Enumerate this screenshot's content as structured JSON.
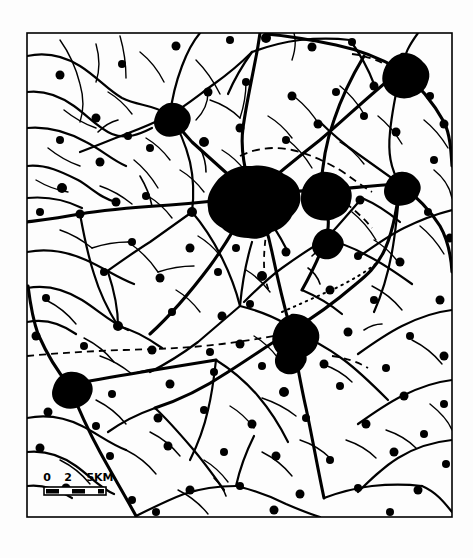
{
  "figure": {
    "kind": "scanned-map",
    "background_color": "#fdfdfd",
    "ink_color": "#000000",
    "width": 473,
    "height": 558
  },
  "frame": {
    "name": "map-neatline",
    "x": 27,
    "y": 33,
    "width": 425,
    "height": 484,
    "stroke_color": "#000000",
    "stroke_width": 1.6
  },
  "scale_bar": {
    "name": "scale-bar",
    "unit_label": "5KM",
    "ticks": [
      "0",
      "2",
      "5KM"
    ],
    "tick_values": [
      0,
      2,
      5
    ],
    "tick_x": [
      47,
      68,
      100
    ],
    "bar": {
      "x": 44,
      "y": 487,
      "width": 62,
      "height": 8,
      "segments": 4,
      "fill_alternating": [
        "#000000",
        "#ffffff",
        "#000000",
        "#ffffff"
      ]
    },
    "label_y": 481,
    "font_size": 11
  },
  "legend_lines": {
    "road_label": "road",
    "boundary_label": "boundary",
    "settlement_label": "built-up area"
  },
  "settlements": [
    {
      "name": "central-city",
      "cx": 252,
      "cy": 196,
      "r": 30,
      "rank": 1
    },
    {
      "name": "east-town",
      "cx": 321,
      "cy": 190,
      "r": 19,
      "rank": 2
    },
    {
      "name": "northeast-town",
      "cx": 401,
      "cy": 70,
      "r": 17,
      "rank": 2
    },
    {
      "name": "south-town",
      "cx": 291,
      "cy": 331,
      "r": 17,
      "rank": 2
    },
    {
      "name": "east-village",
      "cx": 400,
      "cy": 184,
      "r": 13,
      "rank": 3
    },
    {
      "name": "southwest-town",
      "cx": 69,
      "cy": 385,
      "r": 14,
      "rank": 3
    },
    {
      "name": "north-village",
      "cx": 170,
      "cy": 115,
      "r": 13,
      "rank": 3
    },
    {
      "name": "mid-east-village",
      "cx": 325,
      "cy": 240,
      "r": 12,
      "rank": 3
    },
    {
      "name": "south-village",
      "cx": 288,
      "cy": 355,
      "r": 12,
      "rank": 3
    }
  ],
  "boundaries": [
    {
      "name": "west-east-dashed-boundary",
      "style": "dashed"
    },
    {
      "name": "north-arc-dashed-boundary",
      "style": "dashed"
    },
    {
      "name": "central-vertical-dashed-boundary",
      "style": "dashed"
    },
    {
      "name": "southeast-dotted-boundary",
      "style": "dotted"
    },
    {
      "name": "northeast-dashed-boundary",
      "style": "dashed"
    }
  ]
}
